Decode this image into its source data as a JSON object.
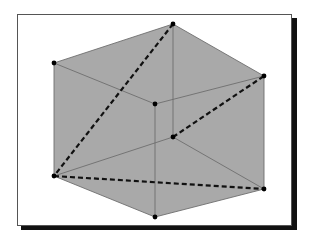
{
  "diagram": {
    "type": "cube-projection",
    "colors": {
      "fill": "#a9a9a9",
      "edge": "#6e6e6e",
      "dashed": "#111111",
      "vertex": "#000000",
      "frame_border": "#555555",
      "frame_shadow": "#111111"
    },
    "vertices": {
      "top": [
        173,
        24
      ],
      "upper_left": [
        54,
        63
      ],
      "upper_right": [
        264,
        76
      ],
      "front_center": [
        155,
        104
      ],
      "back_inner": [
        173,
        137
      ],
      "lower_left": [
        54,
        176
      ],
      "lower_right": [
        264,
        189
      ],
      "bottom": [
        155,
        217
      ]
    },
    "solid_edges": [
      [
        "top",
        "upper_left"
      ],
      [
        "top",
        "upper_right"
      ],
      [
        "upper_left",
        "front_center"
      ],
      [
        "upper_right",
        "front_center"
      ],
      [
        "upper_left",
        "lower_left"
      ],
      [
        "upper_right",
        "lower_right"
      ],
      [
        "front_center",
        "bottom"
      ],
      [
        "lower_left",
        "bottom"
      ],
      [
        "lower_right",
        "bottom"
      ],
      [
        "top",
        "back_inner"
      ],
      [
        "lower_left",
        "back_inner"
      ],
      [
        "lower_right",
        "back_inner"
      ]
    ],
    "dashed_edges": [
      [
        "top",
        "lower_left"
      ],
      [
        "back_inner",
        "upper_right"
      ],
      [
        "lower_left",
        "lower_right"
      ]
    ]
  }
}
